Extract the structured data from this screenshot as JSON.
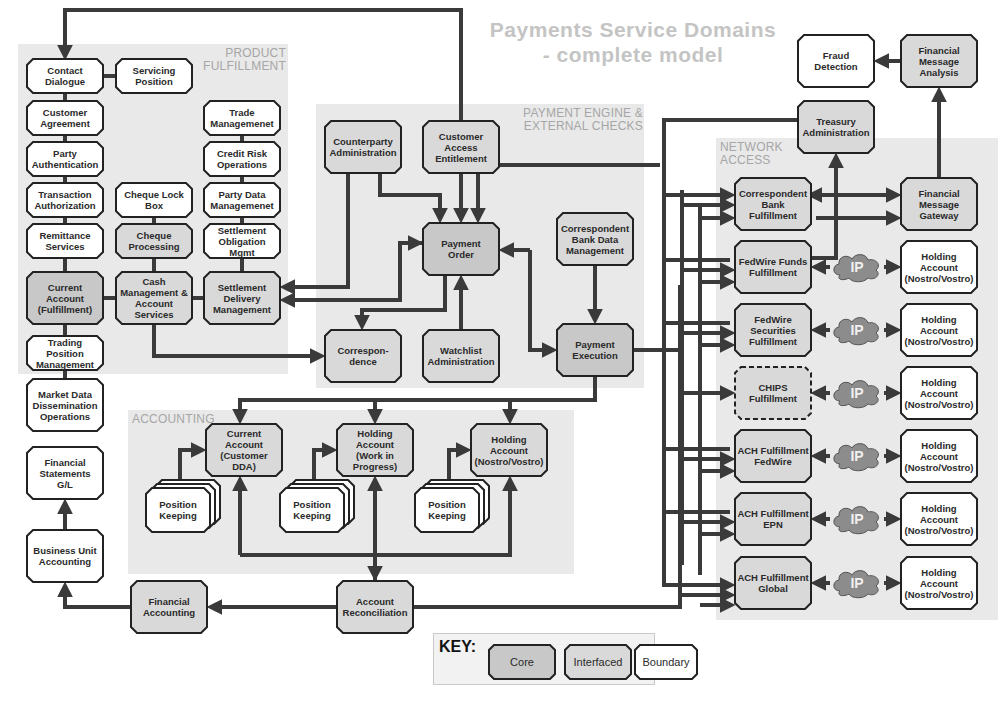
{
  "title": "Payments Service Domains - complete model",
  "colors": {
    "core": "#c8c8c8",
    "interfaced": "#d9d9d9",
    "boundary": "#ffffff",
    "region": "#e9e9e9",
    "line": "#3a3a3a",
    "region_label": "#a6a6a6",
    "title": "#c4c4c4",
    "cloud": "#8c8c8c"
  },
  "regions": {
    "product_fulfillment": "PRODUCT\nFULFILLMENT",
    "payment_engine": "PAYMENT ENGINE &\nEXTERNAL CHECKS",
    "network_access": "NETWORK\nACCESS",
    "accounting": "ACCOUNTING"
  },
  "nodes": {
    "contact_dialogue": {
      "label": "Contact\nDialogue",
      "type": "boundary"
    },
    "servicing_position": {
      "label": "Servicing\nPosition",
      "type": "boundary"
    },
    "customer_agreement": {
      "label": "Customer\nAgreement",
      "type": "boundary"
    },
    "party_authentication": {
      "label": "Party\nAuthentication",
      "type": "boundary"
    },
    "transaction_authorization": {
      "label": "Transaction\nAuthorization",
      "type": "boundary"
    },
    "remittance_services": {
      "label": "Remittance\nServices",
      "type": "boundary"
    },
    "current_account_fulfillment": {
      "label": "Current\nAccount\n(Fulfillment)",
      "type": "core"
    },
    "trading_position_management": {
      "label": "Trading Position\nManagement",
      "type": "boundary"
    },
    "market_data_dissemination": {
      "label": "Market Data\nDissemination\nOperations",
      "type": "boundary"
    },
    "cheque_lock_box": {
      "label": "Cheque Lock\nBox",
      "type": "boundary"
    },
    "cheque_processing": {
      "label": "Cheque\nProcessing",
      "type": "interfaced"
    },
    "cash_management": {
      "label": "Cash\nManagement &\nAccount\nServices",
      "type": "interfaced"
    },
    "trade_management": {
      "label": "Trade\nManagemenet",
      "type": "boundary"
    },
    "credit_risk_operations": {
      "label": "Credit Risk\nOperations",
      "type": "boundary"
    },
    "party_data_management": {
      "label": "Party Data\nManagemenet",
      "type": "boundary"
    },
    "settlement_obligation_mgmt": {
      "label": "Settlement\nObligation Mgmt",
      "type": "boundary"
    },
    "settlement_delivery_management": {
      "label": "Settlement\nDelivery\nManagement",
      "type": "interfaced"
    },
    "counterparty_administration": {
      "label": "Counterparty\nAdministration",
      "type": "interfaced"
    },
    "customer_access_entitlement": {
      "label": "Customer\nAccess\nEntitlement",
      "type": "interfaced"
    },
    "payment_order": {
      "label": "Payment\nOrder",
      "type": "core"
    },
    "correspondent_bank_data_management": {
      "label": "Correspondent\nBank Data\nManagement",
      "type": "interfaced"
    },
    "correspondence": {
      "label": "Correspon-\ndence",
      "type": "interfaced"
    },
    "watchlist_administration": {
      "label": "Watchlist\nAdministration",
      "type": "interfaced"
    },
    "payment_execution": {
      "label": "Payment\nExecution",
      "type": "core"
    },
    "fraud_detection": {
      "label": "Fraud Detection",
      "type": "boundary"
    },
    "financial_message_analysis": {
      "label": "Financial\nMessage\nAnalysis",
      "type": "interfaced"
    },
    "treasury_administration": {
      "label": "Treasury\nAdministration",
      "type": "interfaced"
    },
    "correspondent_bank_fulfillment": {
      "label": "Correspondent\nBank\nFulfillment",
      "type": "interfaced"
    },
    "financial_message_gateway": {
      "label": "Financial\nMessage\nGateway",
      "type": "interfaced"
    },
    "fedwire_funds_fulfillment": {
      "label": "FedWire Funds\nFulfillment",
      "type": "interfaced"
    },
    "fedwire_securities_fulfillment": {
      "label": "FedWire\nSecurities\nFulfillment",
      "type": "interfaced"
    },
    "chips_fulfillment": {
      "label": "CHIPS\nFulfillment",
      "type": "interfaced-dashed"
    },
    "ach_fulfillment_fedwire": {
      "label": "ACH Fulfillment\nFedWire",
      "type": "interfaced"
    },
    "ach_fulfillment_epn": {
      "label": "ACH Fulfillment\nEPN",
      "type": "interfaced"
    },
    "ach_fulfillment_global": {
      "label": "ACH Fulfillment\nGlobal",
      "type": "interfaced"
    },
    "holding_account_nv_1": {
      "label": "Holding\nAccount\n(Nostro/Vostro)",
      "type": "boundary"
    },
    "holding_account_nv_2": {
      "label": "Holding\nAccount\n(Nostro/Vostro)",
      "type": "boundary"
    },
    "holding_account_nv_3": {
      "label": "Holding\nAccount\n(Nostro/Vostro)",
      "type": "boundary"
    },
    "holding_account_nv_4": {
      "label": "Holding\nAccount\n(Nostro/Vostro)",
      "type": "boundary"
    },
    "holding_account_nv_5": {
      "label": "Holding\nAccount\n(Nostro/Vostro)",
      "type": "boundary"
    },
    "holding_account_nv_6": {
      "label": "Holding\nAccount\n(Nostro/Vostro)",
      "type": "boundary"
    },
    "current_account_dda": {
      "label": "Current\nAccount\n(Customer DDA)",
      "type": "interfaced"
    },
    "holding_account_wip": {
      "label": "Holding Account\n(Work in\nProgress)",
      "type": "interfaced"
    },
    "holding_account_nv_acct": {
      "label": "Holding\nAccount\n(Nostro/Vostro)",
      "type": "interfaced"
    },
    "position_keeping_1": {
      "label": "Position\nKeeping",
      "type": "boundary-stack"
    },
    "position_keeping_2": {
      "label": "Position\nKeeping",
      "type": "boundary-stack"
    },
    "position_keeping_3": {
      "label": "Position\nKeeping",
      "type": "boundary-stack"
    },
    "financial_statements_gl": {
      "label": "Financial\nStatements\nG/L",
      "type": "boundary"
    },
    "business_unit_accounting": {
      "label": "Business Unit\nAccounting",
      "type": "boundary"
    },
    "financial_accounting": {
      "label": "Financial\nAccounting",
      "type": "interfaced"
    },
    "account_reconciliation": {
      "label": "Account\nReconciliation",
      "type": "interfaced"
    }
  },
  "cloud_label": "IP",
  "key": {
    "title": "KEY:",
    "items": [
      {
        "label": "Core",
        "type": "core"
      },
      {
        "label": "Interfaced",
        "type": "interfaced"
      },
      {
        "label": "Boundary",
        "type": "boundary"
      }
    ]
  }
}
